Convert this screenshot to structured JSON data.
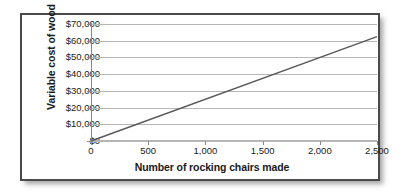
{
  "chart_data": {
    "type": "line",
    "title": "",
    "xlabel": "Number of rocking chairs made",
    "ylabel": "Variable cost of wood",
    "x": [
      0,
      2500
    ],
    "values": [
      0,
      62500
    ],
    "series": [
      {
        "name": "Variable cost of wood",
        "x": [
          0,
          2500
        ],
        "values": [
          0,
          62500
        ],
        "color": "#595959"
      }
    ],
    "xlim": [
      0,
      2500
    ],
    "ylim": [
      0,
      70000
    ],
    "xticks": [
      0,
      500,
      1000,
      1500,
      2000,
      2500
    ],
    "yticks": [
      0,
      10000,
      20000,
      30000,
      40000,
      50000,
      60000,
      70000
    ],
    "xtick_labels": [
      "0",
      "500",
      "1,000",
      "1,500",
      "2,000",
      "2,500"
    ],
    "ytick_labels": [
      "$0",
      "$10,000",
      "$20,000",
      "$30,000",
      "$40,000",
      "$50,000",
      "$60,000",
      "$70,000"
    ],
    "grid": "horizontal",
    "legend": "none",
    "slope_per_unit": 25,
    "annotations": []
  },
  "frame": {
    "border_color": "#4a4a4a",
    "background": "#ffffff"
  },
  "axes": {
    "gridline_color": "#b6b6b6",
    "axis_line_color": "#8a8a8a",
    "text_color": "#1a1a1a"
  }
}
